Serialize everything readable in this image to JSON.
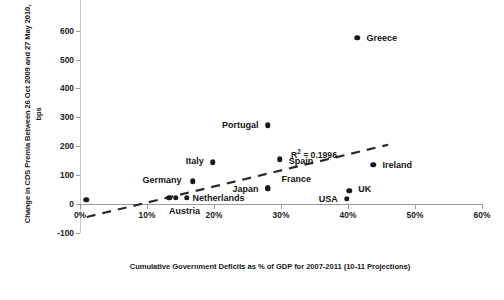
{
  "chart_data": {
    "type": "scatter",
    "title": "",
    "xlabel": "Cumulative Government Deficits as % of GDP for 2007-2011 (10-11 Projections)",
    "ylabel": "Change in CDS Premia Between 26 Oct 2009 and 27 May 2010, bps",
    "xlim": [
      0,
      60
    ],
    "ylim": [
      -100,
      600
    ],
    "xticks": [
      "0%",
      "10%",
      "20%",
      "30%",
      "40%",
      "50%",
      "60%"
    ],
    "xtick_values": [
      0,
      10,
      20,
      30,
      40,
      50,
      60
    ],
    "yticks": [
      "-100",
      "0",
      "100",
      "200",
      "300",
      "400",
      "500",
      "600"
    ],
    "ytick_values": [
      -100,
      0,
      100,
      200,
      300,
      400,
      500,
      600
    ],
    "grid": false,
    "legend": "none",
    "annotation": "R² = 0.1996",
    "r_squared": 0.1996,
    "trendline": {
      "type": "linear-dashed",
      "x_start": 1.0,
      "y_start": -45,
      "x_end": 46.0,
      "y_end": 205
    },
    "points": [
      {
        "label": "Greece",
        "x": 41.4,
        "y": 575,
        "label_pos": "right"
      },
      {
        "label": "Portugal",
        "x": 28.0,
        "y": 272,
        "label_pos": "left"
      },
      {
        "label": "Spain",
        "x": 29.8,
        "y": 155,
        "label_pos": "right"
      },
      {
        "label": "Italy",
        "x": 19.8,
        "y": 145,
        "label_pos": "left"
      },
      {
        "label": "Ireland",
        "x": 43.8,
        "y": 135,
        "label_pos": "right"
      },
      {
        "label": "Germany",
        "x": 16.8,
        "y": 78,
        "label_pos": "left"
      },
      {
        "label": "Japan",
        "x": 28.0,
        "y": 55,
        "label_pos": "left"
      },
      {
        "label": "France",
        "x": 28.0,
        "y": 55,
        "label_pos": "none"
      },
      {
        "label": "UK",
        "x": 40.2,
        "y": 45,
        "label_pos": "right"
      },
      {
        "label": "USA",
        "x": 39.8,
        "y": 18,
        "label_pos": "left"
      },
      {
        "label": "Netherlands",
        "x": 15.9,
        "y": 22,
        "label_pos": "right"
      },
      {
        "label": "Austria",
        "x": 13.3,
        "y": 22,
        "label_pos": "below"
      },
      {
        "label": "",
        "x": 14.3,
        "y": 22,
        "label_pos": "none"
      },
      {
        "label": "",
        "x": 0.9,
        "y": 15,
        "label_pos": "none"
      }
    ],
    "point_labels_rendered": [
      {
        "text": "Greece",
        "anchor": "right"
      },
      {
        "text": "Portugal",
        "anchor": "left"
      },
      {
        "text": "Spain",
        "anchor": "right"
      },
      {
        "text": "Italy",
        "anchor": "left"
      },
      {
        "text": "Ireland",
        "anchor": "right"
      },
      {
        "text": "Germany",
        "anchor": "left"
      },
      {
        "text": "Japan",
        "anchor": "left"
      },
      {
        "text": "France",
        "anchor": "right"
      },
      {
        "text": "UK",
        "anchor": "right"
      },
      {
        "text": "USA",
        "anchor": "left"
      },
      {
        "text": "Netherlands",
        "anchor": "right"
      },
      {
        "text": "Austria",
        "anchor": "below"
      }
    ],
    "colors": {
      "marker": "#1a1a1a",
      "axis": "#9a9a9a",
      "text": "#141414",
      "trendline": "#2a2a2a"
    }
  }
}
